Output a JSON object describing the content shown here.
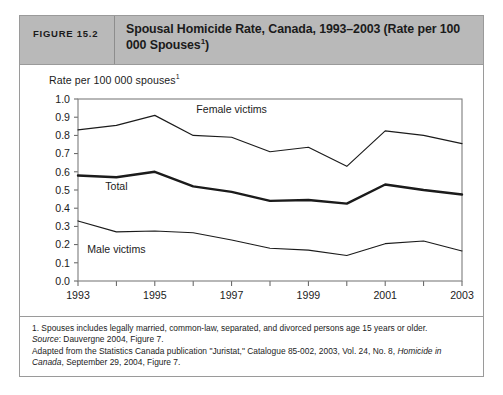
{
  "figure": {
    "number_label": "FIGURE 15.2",
    "title": "Spousal Homicide Rate, Canada, 1993–2003 (Rate per 100 000 Spouses",
    "title_superscript": "1",
    "title_suffix": ")",
    "axis_caption": "Rate per 100 000 spouses",
    "axis_caption_superscript": "1",
    "notes": {
      "footnote_1": "1. Spouses includes legally married, common-law, separated, and divorced persons age 15 years or older.",
      "source_label": "Source",
      "source_text": ": Dauvergne 2004, Figure 7.",
      "adapted_prefix": "Adapted from the Statistics Canada publication \"Juristat,\" Catalogue 85-002, 2003, Vol. 24, No. 8, ",
      "adapted_italic": "Homicide in Canada",
      "adapted_suffix": ", September 29, 2004, Figure 7."
    },
    "colors": {
      "header_background": "#b9b9b9",
      "card_border": "#9a9a9a",
      "line": "#1b1b1b",
      "frame": "#7d7d7d",
      "page_background": "#ffffff"
    }
  },
  "chart_data": {
    "type": "line",
    "xlabel": "",
    "ylabel": "Rate per 100 000 spouses",
    "x": [
      1993,
      1994,
      1995,
      1996,
      1997,
      1998,
      1999,
      2000,
      2001,
      2002,
      2003
    ],
    "xlim": [
      1993,
      2003
    ],
    "ylim": [
      0.0,
      1.0
    ],
    "ytick_labels": [
      "0.0",
      "0.1",
      "0.2",
      "0.3",
      "0.4",
      "0.5",
      "0.6",
      "0.7",
      "0.8",
      "0.9",
      "1.0"
    ],
    "ytick_values": [
      0.0,
      0.1,
      0.2,
      0.3,
      0.4,
      0.5,
      0.6,
      0.7,
      0.8,
      0.9,
      1.0
    ],
    "xtick_values": [
      1993,
      1994,
      1995,
      1996,
      1997,
      1998,
      1999,
      2000,
      2001,
      2002,
      2003
    ],
    "xtick_labels_shown": [
      "1993",
      "",
      "1995",
      "",
      "1997",
      "",
      "1999",
      "",
      "2001",
      "",
      "2003"
    ],
    "grid": false,
    "legend": "inline-labels",
    "series": [
      {
        "name": "Female victims",
        "label_x": 1997.0,
        "label_y": 0.925,
        "stroke": "thin",
        "values": [
          0.83,
          0.855,
          0.91,
          0.8,
          0.79,
          0.71,
          0.735,
          0.63,
          0.825,
          0.8,
          0.755
        ]
      },
      {
        "name": "Total",
        "label_x": 1994.0,
        "label_y": 0.5,
        "stroke": "thick",
        "values": [
          0.58,
          0.57,
          0.6,
          0.52,
          0.49,
          0.44,
          0.445,
          0.425,
          0.53,
          0.5,
          0.475
        ]
      },
      {
        "name": "Male victims",
        "label_x": 1994.0,
        "label_y": 0.155,
        "stroke": "thin",
        "values": [
          0.33,
          0.27,
          0.275,
          0.265,
          0.225,
          0.18,
          0.17,
          0.14,
          0.205,
          0.22,
          0.165
        ]
      }
    ]
  }
}
